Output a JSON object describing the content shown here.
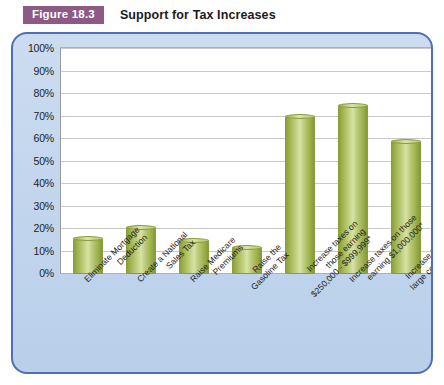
{
  "header": {
    "badge": "Figure 18.3",
    "title": "Support for Tax Increases"
  },
  "colors": {
    "badge_bg": "#8c5a84",
    "panel_border": "#4f6fb5",
    "panel_bg": "#c3d6ee",
    "bar_fill": "#b7c878",
    "bar_edge": "#8a9c3d",
    "plot_bg": "#ffffff",
    "gridline": "#c9c9c9"
  },
  "chart_data": {
    "type": "bar",
    "title": "Support for Tax Increases",
    "xlabel": "",
    "ylabel": "",
    "ylim": [
      0,
      100
    ],
    "ytick_labels": [
      "100%",
      "90%",
      "80%",
      "70%",
      "60%",
      "50%",
      "40%",
      "30%",
      "20%",
      "10%",
      "0%"
    ],
    "ytick_values": [
      100,
      90,
      80,
      70,
      60,
      50,
      40,
      30,
      20,
      10,
      0
    ],
    "grid": true,
    "legend": "none",
    "categories": [
      "Eliminate Mortgage Deduction",
      "Create a National Sales Tax",
      "Raise Medicare Premiums",
      "Raise the Gasoline Tax",
      "Increase taxes on those earning $250,000 - $999,999*",
      "Increase taxes on those earning $1,000,000*",
      "Increase taxes on large corporations*"
    ],
    "category_lines": [
      [
        "Eliminate Mortgage",
        "Deduction"
      ],
      [
        "Create a National",
        "Sales Tax"
      ],
      [
        "Raise Medicare",
        "Premiums"
      ],
      [
        "Raise the",
        "Gasoline Tax"
      ],
      [
        "Increase taxes on",
        "those earning",
        "$250,000 - $999,999*"
      ],
      [
        "Increase taxes on those",
        "earning $1,000,000*"
      ],
      [
        "Increase taxes on",
        "large corporations*"
      ]
    ],
    "values": [
      16,
      21,
      15,
      12,
      70,
      75,
      59
    ]
  }
}
